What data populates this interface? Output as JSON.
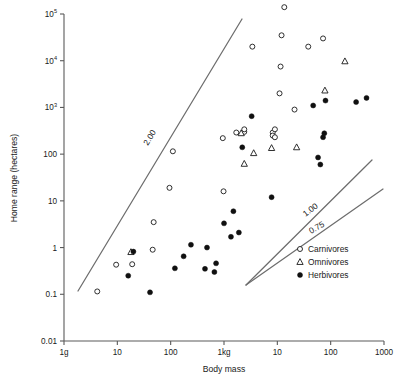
{
  "chart_data": {
    "type": "scatter",
    "title": "",
    "xlabel": "Body mass",
    "ylabel": "Home range (hectares)",
    "x_scale": "log",
    "y_scale": "log",
    "xlim": [
      1,
      1000000
    ],
    "ylim": [
      0.01,
      100000
    ],
    "grid": false,
    "legend_position": "bottom-right",
    "x_tick_labels": [
      "1g",
      "10",
      "100",
      "1kg",
      "10",
      "100",
      "1000"
    ],
    "x_tick_values": [
      1,
      10,
      100,
      1000,
      10000,
      100000,
      1000000
    ],
    "y_tick_labels": [
      "10⁵",
      "10⁴",
      "10³",
      "100",
      "10",
      "1",
      "0.1",
      "0.01"
    ],
    "y_tick_values": [
      100000,
      10000,
      1000,
      100,
      10,
      1,
      0.1,
      0.01
    ],
    "legend": [
      {
        "name": "Carnivores",
        "marker": "open-circle"
      },
      {
        "name": "Omnivores",
        "marker": "open-triangle"
      },
      {
        "name": "Herbivores",
        "marker": "filled-circle"
      }
    ],
    "annotations": [
      {
        "text": "2.00",
        "slope": 2.0,
        "x": 152,
        "y": 139,
        "rotation": -58
      },
      {
        "text": "1.00",
        "slope": 1.0,
        "x": 312,
        "y": 212,
        "rotation": -37
      },
      {
        "text": "0.75",
        "slope": 0.75,
        "x": 318,
        "y": 230,
        "rotation": -30
      }
    ],
    "reference_lines": [
      {
        "label": "2.00",
        "x1": 78,
        "y1": 291,
        "x2": 242,
        "y2": 19
      },
      {
        "label": "1.00",
        "x1": 246,
        "y1": 285,
        "x2": 372,
        "y2": 160
      },
      {
        "label": "0.75",
        "x1": 246,
        "y1": 285,
        "x2": 383,
        "y2": 189
      }
    ],
    "series": [
      {
        "name": "Carnivores",
        "marker": "open-circle",
        "points": [
          [
            4.2,
            0.115
          ],
          [
            9.5,
            0.43
          ],
          [
            19,
            0.44
          ],
          [
            46,
            0.9
          ],
          [
            95,
            19
          ],
          [
            48,
            3.5
          ],
          [
            110,
            115
          ],
          [
            980,
            16
          ],
          [
            950,
            220
          ],
          [
            1700,
            290
          ],
          [
            3400,
            20000
          ],
          [
            8200,
            290
          ],
          [
            8200,
            250
          ],
          [
            9000,
            340
          ],
          [
            9000,
            230
          ],
          [
            11000,
            2000
          ],
          [
            11500,
            7500
          ],
          [
            12000,
            35000
          ],
          [
            13500,
            140000
          ],
          [
            21000,
            900
          ],
          [
            38000,
            20000
          ],
          [
            72000,
            30000
          ],
          [
            2400,
            300
          ],
          [
            2400,
            340
          ]
        ]
      },
      {
        "name": "Omnivores",
        "marker": "open-triangle",
        "points": [
          [
            18,
            0.8
          ],
          [
            2100,
            280
          ],
          [
            2400,
            62
          ],
          [
            3600,
            105
          ],
          [
            7800,
            135
          ],
          [
            23000,
            140
          ],
          [
            78000,
            2300
          ],
          [
            185000,
            9700
          ]
        ]
      },
      {
        "name": "Herbivores",
        "marker": "filled-circle",
        "points": [
          [
            16,
            0.25
          ],
          [
            20,
            0.82
          ],
          [
            41,
            0.11
          ],
          [
            120,
            0.36
          ],
          [
            175,
            0.65
          ],
          [
            240,
            1.15
          ],
          [
            440,
            0.35
          ],
          [
            480,
            1.0
          ],
          [
            660,
            0.3
          ],
          [
            710,
            0.46
          ],
          [
            1000,
            3.3
          ],
          [
            1350,
            1.7
          ],
          [
            1500,
            6.0
          ],
          [
            1900,
            2.1
          ],
          [
            2200,
            140
          ],
          [
            3300,
            650
          ],
          [
            7800,
            12
          ],
          [
            47000,
            1100
          ],
          [
            58000,
            85
          ],
          [
            64000,
            60
          ],
          [
            72000,
            230
          ],
          [
            76000,
            280
          ],
          [
            80000,
            1400
          ],
          [
            300000,
            1300
          ],
          [
            470000,
            1600
          ]
        ]
      }
    ]
  },
  "axes": {
    "x_title": "Body mass",
    "y_title": "Home range (hectares)"
  },
  "legend_box": {
    "items": [
      {
        "label": "Carnivores"
      },
      {
        "label": "Omnivores"
      },
      {
        "label": "Herbivores"
      }
    ]
  }
}
